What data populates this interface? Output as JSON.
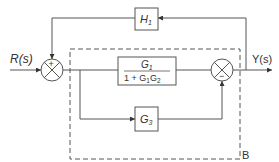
{
  "diagram": {
    "type": "block-diagram",
    "colors": {
      "line": "#555555",
      "dashed": "#555555",
      "text": "#333333"
    },
    "input": {
      "label": "R(s)"
    },
    "output": {
      "label": "Y(s)"
    },
    "blocks": {
      "h1": {
        "label": "H",
        "sub": "1"
      },
      "main": {
        "num": "G",
        "num_sub": "1",
        "den_prefix": "1 + G",
        "den_sub1": "1",
        "den_mid": "G",
        "den_sub2": "2"
      },
      "g3": {
        "label": "G",
        "sub": "3"
      }
    },
    "junctions": {
      "sum1": {
        "top_sign": "+"
      },
      "sum2": {
        "bottom_sign": "−"
      }
    },
    "region": {
      "label": "B"
    }
  }
}
